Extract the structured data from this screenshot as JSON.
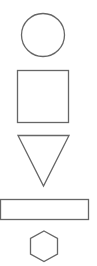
{
  "canvas": {
    "width": 97,
    "height": 266,
    "background": "#ffffff"
  },
  "style": {
    "stroke": "#666666",
    "stroke_width": 1.3,
    "fill": "none"
  },
  "shapes": [
    {
      "type": "circle",
      "label": "circle"
    },
    {
      "type": "square",
      "label": "square"
    },
    {
      "type": "triangle",
      "label": "inverted-triangle"
    },
    {
      "type": "rectangle",
      "label": "rectangle"
    },
    {
      "type": "hexagon",
      "label": "hexagon"
    }
  ]
}
